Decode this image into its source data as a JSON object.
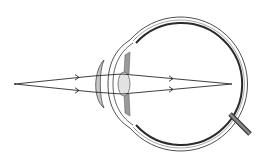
{
  "diagram": {
    "colors": {
      "background": "#ffffff",
      "line": "#2a2a2a",
      "sclera_fill": "#ffffff",
      "lens_fill": "#c8c8c8",
      "eye_lens_fill": "#e2e2e2",
      "iris_fill": "#9a9a9a",
      "nerve_fill": "#555555"
    },
    "elements": [
      {
        "id": "object-point",
        "label": "object point",
        "x": 15,
        "y": 84
      },
      {
        "id": "corrective-lens",
        "label": "convex meniscus lens"
      },
      {
        "id": "cornea",
        "label": "cornea"
      },
      {
        "id": "eye-lens",
        "label": "crystalline lens"
      },
      {
        "id": "iris",
        "label": "iris"
      },
      {
        "id": "eyeball",
        "label": "eyeball",
        "cx": 178,
        "cy": 84,
        "r": 66
      },
      {
        "id": "retina",
        "label": "retina"
      },
      {
        "id": "focal-point",
        "label": "focal point on retina",
        "x": 232,
        "y": 84
      },
      {
        "id": "optic-nerve",
        "label": "optic nerve"
      }
    ],
    "rays": [
      {
        "id": "upper-ray",
        "points": [
          [
            15,
            84
          ],
          [
            93,
            76
          ],
          [
            122,
            74
          ],
          [
            232,
            84
          ]
        ]
      },
      {
        "id": "lower-ray",
        "points": [
          [
            15,
            84
          ],
          [
            93,
            92
          ],
          [
            122,
            94
          ],
          [
            232,
            84
          ]
        ]
      }
    ]
  }
}
